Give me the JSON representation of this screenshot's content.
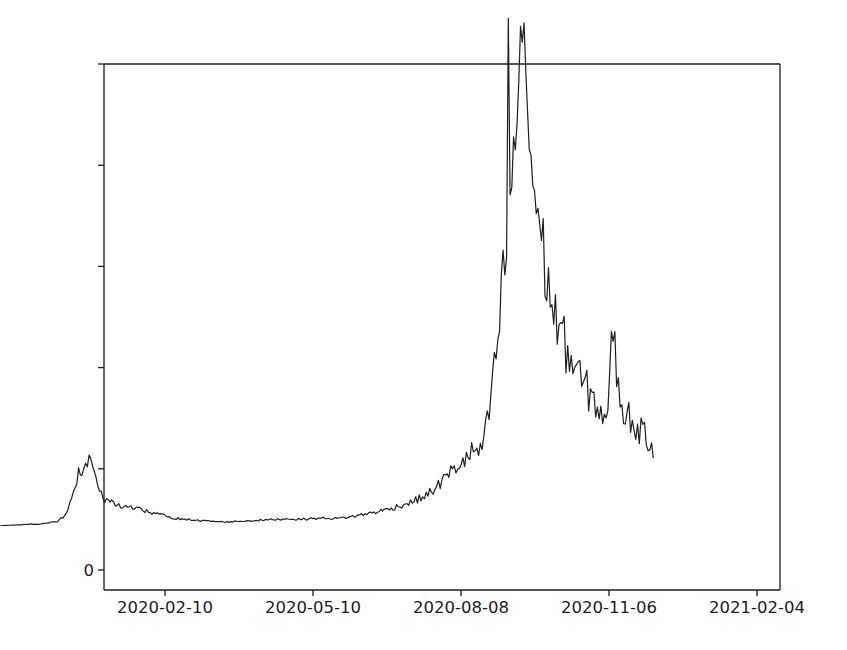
{
  "chart_data": {
    "type": "line",
    "title": "Daily Increase of Confirmed cases",
    "xlabel": "",
    "ylabel": "",
    "grid": false,
    "legend": null,
    "legend_position": "none",
    "line_color": "#1f1f1f",
    "line_width": 1.2,
    "background": "#ffffff",
    "xlim": [
      "2020-01-22",
      "2021-02-12"
    ],
    "ylim": [
      0,
      10000
    ],
    "ytick_labels": [
      "0",
      "2000",
      "4000",
      "6000",
      "8000",
      "10000"
    ],
    "ytick_values": [
      0,
      2000,
      4000,
      6000,
      8000,
      10000
    ],
    "xtick_labels": [
      "2020-02-10",
      "2020-05-10",
      "2020-08-08",
      "2020-11-06",
      "2021-02-04"
    ],
    "xtick_values": [
      "2020-02-10",
      "2020-05-10",
      "2020-08-08",
      "2020-11-06",
      "2021-02-04"
    ],
    "annotations": [],
    "x": [
      "2020-01-22",
      "2020-01-25",
      "2020-01-28",
      "2020-01-31",
      "2020-02-03",
      "2020-02-06",
      "2020-02-09",
      "2020-02-12",
      "2020-02-15",
      "2020-02-18",
      "2020-02-21",
      "2020-02-24",
      "2020-02-27",
      "2020-03-01",
      "2020-03-04",
      "2020-03-07",
      "2020-03-10",
      "2020-03-13",
      "2020-03-16",
      "2020-03-19",
      "2020-03-22",
      "2020-03-25",
      "2020-03-28",
      "2020-03-31",
      "2020-04-03",
      "2020-04-06",
      "2020-04-09",
      "2020-04-12",
      "2020-04-15",
      "2020-04-18",
      "2020-04-21",
      "2020-04-24",
      "2020-04-27",
      "2020-04-30",
      "2020-05-03",
      "2020-05-06",
      "2020-05-09",
      "2020-05-12",
      "2020-05-15",
      "2020-05-18",
      "2020-05-21",
      "2020-05-24",
      "2020-05-27",
      "2020-05-30",
      "2020-06-02",
      "2020-06-05",
      "2020-06-08",
      "2020-06-11",
      "2020-06-14",
      "2020-06-17",
      "2020-06-20",
      "2020-06-23",
      "2020-06-26",
      "2020-06-29",
      "2020-07-02",
      "2020-07-05",
      "2020-07-08",
      "2020-07-11",
      "2020-07-14",
      "2020-07-17",
      "2020-07-20",
      "2020-07-23",
      "2020-07-26",
      "2020-07-29",
      "2020-08-01",
      "2020-08-04",
      "2020-08-07",
      "2020-08-10",
      "2020-08-13",
      "2020-08-16",
      "2020-08-19",
      "2020-08-22",
      "2020-08-25",
      "2020-08-28",
      "2020-08-31",
      "2020-09-03",
      "2020-09-06",
      "2020-09-09",
      "2020-09-12",
      "2020-09-15",
      "2020-09-18",
      "2020-09-21",
      "2020-09-24",
      "2020-09-27",
      "2020-09-30",
      "2020-10-03",
      "2020-10-06",
      "2020-10-09",
      "2020-10-12",
      "2020-10-15",
      "2020-10-18",
      "2020-10-21",
      "2020-10-24",
      "2020-10-27",
      "2020-10-30",
      "2020-11-02",
      "2020-11-05",
      "2020-11-08",
      "2020-11-11",
      "2020-11-14",
      "2020-11-17",
      "2020-11-20",
      "2020-11-23",
      "2020-11-26",
      "2020-11-29",
      "2020-12-02",
      "2020-12-05",
      "2020-12-08",
      "2020-12-11",
      "2020-12-14",
      "2020-12-17",
      "2020-12-20",
      "2020-12-23",
      "2020-12-26",
      "2020-12-29",
      "2021-01-01",
      "2021-01-04",
      "2021-01-07",
      "2021-01-10",
      "2021-01-13",
      "2021-01-16",
      "2021-01-19",
      "2021-01-22",
      "2021-01-25",
      "2021-01-28",
      "2021-01-31"
    ],
    "values_description": "Daily new confirmed cases, full daily series (sampled points below at ~3-day spacing; intermediate daily noise rendered in path)",
    "y": [
      5,
      10,
      15,
      20,
      25,
      30,
      35,
      28,
      40,
      55,
      70,
      90,
      160,
      340,
      620,
      980,
      1180,
      1350,
      900,
      640,
      480,
      520,
      430,
      380,
      400,
      360,
      330,
      300,
      270,
      250,
      230,
      200,
      180,
      150,
      140,
      130,
      120,
      110,
      100,
      95,
      90,
      85,
      80,
      75,
      80,
      85,
      90,
      95,
      100,
      105,
      110,
      115,
      120,
      125,
      130,
      135,
      130,
      125,
      130,
      135,
      140,
      145,
      150,
      145,
      140,
      150,
      160,
      175,
      190,
      210,
      230,
      250,
      270,
      290,
      310,
      340,
      370,
      400,
      430,
      470,
      510,
      560,
      620,
      700,
      800,
      900,
      1010,
      1100,
      1180,
      1260,
      1380,
      1400,
      1450,
      1900,
      2600,
      3500,
      4600,
      5700,
      6900,
      8300,
      9650,
      7100,
      6300,
      5600,
      4900,
      4300,
      3900,
      3600,
      3350,
      3100,
      2900,
      2700,
      2550,
      2400,
      2250,
      2100,
      1950,
      3700,
      2500,
      2200,
      2050,
      1900,
      1800,
      1700,
      1600,
      1450,
      1300
    ],
    "peak_annotations": {
      "spring_peak": {
        "date": "2020-03-13",
        "value": 1350
      },
      "winter_peak": {
        "date": "2020-11-08",
        "value": 9650
      },
      "late_spike": {
        "date": "2021-01-06",
        "value": 3700
      },
      "last_value": {
        "date": "2021-01-31",
        "value": 1300
      }
    }
  },
  "axes": {
    "left_spine": true,
    "right_spine": true,
    "top_spine": true,
    "bottom_spine": true,
    "tick_direction": "out",
    "spine_color": "#1c1c1c"
  }
}
